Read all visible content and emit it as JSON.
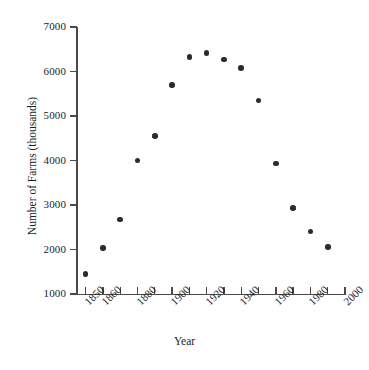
{
  "chart_data": {
    "type": "scatter",
    "title": "",
    "xlabel": "Year",
    "ylabel": "Number of Farms (thousands)",
    "xlim": [
      1845,
      2000
    ],
    "ylim": [
      1000,
      7000
    ],
    "grid": false,
    "legend": null,
    "x_tick_labels": [
      "1850",
      "1860",
      "1880",
      "1900",
      "1920",
      "1940",
      "1960",
      "1980",
      "2000"
    ],
    "x_tick_values": [
      1850,
      1860,
      1880,
      1900,
      1920,
      1940,
      1960,
      1980,
      2000
    ],
    "x_minor_ticks": [
      1850,
      1860,
      1870,
      1880,
      1890,
      1900,
      1910,
      1920,
      1930,
      1940,
      1950,
      1960,
      1970,
      1980,
      1990,
      2000
    ],
    "y_tick_labels": [
      "1000",
      "2000",
      "3000",
      "4000",
      "5000",
      "6000",
      "7000"
    ],
    "y_tick_values": [
      1000,
      2000,
      3000,
      4000,
      5000,
      6000,
      7000
    ],
    "x": [
      1850,
      1860,
      1870,
      1880,
      1890,
      1900,
      1910,
      1920,
      1930,
      1940,
      1950,
      1960,
      1970,
      1980,
      1990
    ],
    "y": [
      1450,
      2030,
      2670,
      4000,
      4550,
      5700,
      6330,
      6420,
      6270,
      6080,
      5350,
      3930,
      2930,
      2400,
      2050
    ],
    "marker": "filled-circle",
    "marker_color": "#2b2b2b",
    "axis_color": "#4a4a4a",
    "background_color": "#ffffff"
  }
}
